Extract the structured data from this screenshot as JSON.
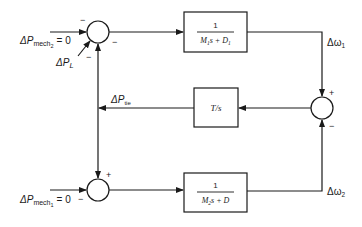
{
  "diagram": {
    "type": "block-diagram",
    "colors": {
      "line": "#1a1a1a",
      "background": "#ffffff"
    },
    "inputs": {
      "mech2": {
        "delta": "ΔP",
        "sub": "mech",
        "subsub": "2",
        "value": "= 0"
      },
      "load": {
        "delta": "ΔP",
        "sub": "L"
      },
      "mech1": {
        "delta": "ΔP",
        "sub": "mech",
        "subsub": "1",
        "value": "= 0"
      }
    },
    "signals": {
      "tie": {
        "delta": "ΔP",
        "sub": "tie"
      },
      "omega1": {
        "delta": "Δω",
        "sub": "1"
      },
      "omega2": {
        "delta": "Δω",
        "sub": "2"
      }
    },
    "blocks": [
      {
        "id": "area1",
        "numerator": "1",
        "denominator_parts": [
          "M",
          "1",
          "s + D",
          "1"
        ]
      },
      {
        "id": "tie-line",
        "label": "T/s"
      },
      {
        "id": "area2",
        "numerator": "1",
        "denominator_parts": [
          "M",
          "2",
          "s + D",
          ""
        ]
      }
    ],
    "summing_junctions": [
      {
        "id": "sum-top",
        "signs": [
          "−",
          "−",
          "−"
        ]
      },
      {
        "id": "sum-right",
        "signs": [
          "+",
          "−"
        ]
      },
      {
        "id": "sum-bottom",
        "signs": [
          "+",
          "−"
        ]
      }
    ]
  }
}
